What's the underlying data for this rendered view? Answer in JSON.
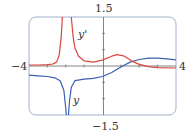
{
  "chart_data": {
    "type": "line",
    "title": "",
    "xlabel": "",
    "ylabel": "",
    "xlim": [
      -4,
      4
    ],
    "ylim": [
      -1.5,
      1.5
    ],
    "grid": false,
    "legend": "inline labels",
    "tick_labels": {
      "x_left": "−4",
      "x_right": "4",
      "y_top": "1.5",
      "y_bottom": "−1.5"
    },
    "vertical_asymptote_x": -1.9,
    "series": [
      {
        "name": "y",
        "label": "y",
        "color": "#3a5fb0",
        "points": [
          [
            -4,
            -0.28
          ],
          [
            -3.5,
            -0.3
          ],
          [
            -3,
            -0.32
          ],
          [
            -2.6,
            -0.36
          ],
          [
            -2.3,
            -0.45
          ],
          [
            -2.1,
            -0.75
          ],
          [
            -2.0,
            -1.3
          ],
          [
            -1.97,
            -1.5
          ],
          [
            -1.85,
            -1.5
          ],
          [
            -1.8,
            -1.1
          ],
          [
            -1.7,
            -0.65
          ],
          [
            -1.5,
            -0.45
          ],
          [
            -1.0,
            -0.4
          ],
          [
            -0.5,
            -0.38
          ],
          [
            0,
            -0.32
          ],
          [
            0.5,
            -0.2
          ],
          [
            1.0,
            -0.03
          ],
          [
            1.5,
            0.12
          ],
          [
            2.0,
            0.2
          ],
          [
            2.5,
            0.24
          ],
          [
            3.0,
            0.24
          ],
          [
            3.5,
            0.22
          ],
          [
            4.0,
            0.19
          ]
        ]
      },
      {
        "name": "y'",
        "label": "y'",
        "color": "#d9473f",
        "points": [
          [
            -4,
            0.03
          ],
          [
            -3.5,
            0.03
          ],
          [
            -3,
            0.04
          ],
          [
            -2.7,
            0.06
          ],
          [
            -2.5,
            0.12
          ],
          [
            -2.35,
            0.35
          ],
          [
            -2.25,
            0.9
          ],
          [
            -2.18,
            1.5
          ],
          [
            -1.7,
            1.5
          ],
          [
            -1.6,
            0.9
          ],
          [
            -1.5,
            0.55
          ],
          [
            -1.3,
            0.3
          ],
          [
            -1.0,
            0.16
          ],
          [
            -0.5,
            0.12
          ],
          [
            0,
            0.18
          ],
          [
            0.5,
            0.3
          ],
          [
            0.8,
            0.35
          ],
          [
            1.2,
            0.3
          ],
          [
            1.6,
            0.15
          ],
          [
            2.0,
            0.05
          ],
          [
            2.5,
            -0.02
          ],
          [
            3.0,
            -0.05
          ],
          [
            4.0,
            -0.06
          ]
        ]
      }
    ]
  }
}
